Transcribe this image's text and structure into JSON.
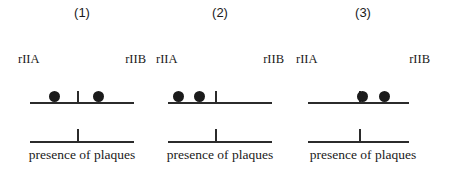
{
  "figure": {
    "width": 453,
    "height": 178,
    "background": "#ffffff",
    "ink_color": "#1b1b1b"
  },
  "panels": [
    {
      "number_label": "(1)",
      "left_gene_label": "rIIA",
      "right_gene_label": "rIIB",
      "caption": "presence of plaques",
      "plaque_dots": 2,
      "dot_positions_pct": [
        24,
        66
      ],
      "upper_tick_pct": 45,
      "lower_tick_pct": 45,
      "panel_left_px": 18,
      "panel_width_px": 128,
      "bar_left_px": 12,
      "bar_width_px": 104
    },
    {
      "number_label": "(2)",
      "left_gene_label": "rIIA",
      "right_gene_label": "rIIB",
      "caption": "presence of plaques",
      "plaque_dots": 2,
      "dot_positions_pct": [
        10,
        30
      ],
      "upper_tick_pct": 45,
      "lower_tick_pct": 45,
      "panel_left_px": 156,
      "panel_width_px": 128,
      "bar_left_px": 12,
      "bar_width_px": 104
    },
    {
      "number_label": "(3)",
      "left_gene_label": "rIIA",
      "right_gene_label": "rIIB",
      "caption": "presence of plaques",
      "plaque_dots": 2,
      "dot_positions_pct": [
        54,
        76
      ],
      "upper_tick_pct": 50,
      "lower_tick_pct": 50,
      "panel_left_px": 296,
      "panel_width_px": 134,
      "bar_left_px": 12,
      "bar_width_px": 101
    }
  ]
}
